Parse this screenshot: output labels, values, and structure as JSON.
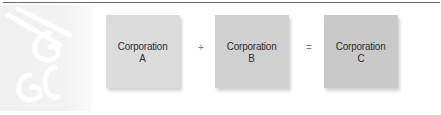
{
  "diagram": {
    "boxes": [
      {
        "title": "Corporation",
        "letter": "A",
        "color": "#dcdcdc"
      },
      {
        "title": "Corporation",
        "letter": "B",
        "color": "#d0d0d0"
      },
      {
        "title": "Corporation",
        "letter": "C",
        "color": "#c9c9c9"
      }
    ],
    "operators": {
      "plus": "+",
      "equals": "="
    }
  },
  "watermark": {
    "icon": "example-script-watermark-icon"
  },
  "colors": {
    "rule": "#6a6a6a",
    "panel": "#f2f2f2",
    "text": "#2e2e2e"
  }
}
